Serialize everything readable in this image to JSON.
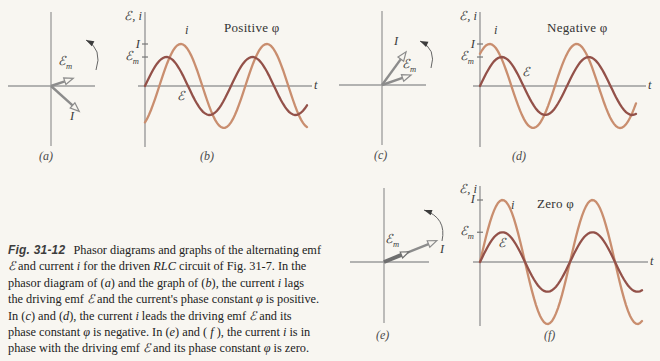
{
  "figure": {
    "symbols": {
      "axis_title": "ℰ, i",
      "emf": "ℰ",
      "m": "m",
      "current_amp": "I",
      "i": "i",
      "t": "t"
    },
    "conditions": {
      "b": "Positive φ",
      "d": "Negative φ",
      "f": "Zero φ"
    },
    "panel_letters": {
      "a": "(a)",
      "b": "(b)",
      "c": "(c)",
      "d": "(d)",
      "e": "(e)",
      "f": "(f)"
    }
  },
  "colors": {
    "current": "#c98e6f",
    "emf": "#935149",
    "axis": "#9b9b9b",
    "phasor_arrow": "#8c8c8c",
    "phasor_arrow_thick": "#6f6f6f",
    "rotation_arrow": "#3c3c3c",
    "background": "#f8f6f1",
    "text": "#3a3a3a"
  },
  "chart_data": [
    {
      "type": "phasor",
      "panel": "a",
      "rotation": "counterclockwise",
      "relationship": "current phasor I below axis: i lags driving emf ℰ, φ positive",
      "arrows": [
        {
          "name": "ℰm",
          "angle_deg": 19,
          "rel_len": 0.62
        },
        {
          "name": "I",
          "angle_deg": -42,
          "rel_len": 1.0
        }
      ]
    },
    {
      "type": "line",
      "panel": "b",
      "title": "Positive φ",
      "ylabel": "ℰ, i",
      "xlabel": "t",
      "yticks": [
        "I",
        "ℰm"
      ],
      "cycles_shown": 1.9,
      "series": [
        {
          "name": "i",
          "amplitude_label": "I",
          "amp_rel": 1.0,
          "phase_deg": -60,
          "color": "current"
        },
        {
          "name": "ℰ",
          "amplitude_label": "ℰm",
          "amp_rel": 0.69,
          "phase_deg": 0,
          "color": "emf"
        }
      ],
      "relationship": "current i lags driving emf ℰ"
    },
    {
      "type": "phasor",
      "panel": "c",
      "rotation": "counterclockwise",
      "relationship": "current phasor I ahead of ℰm: i leads driving emf ℰ, φ negative",
      "arrows": [
        {
          "name": "I",
          "angle_deg": 54,
          "rel_len": 1.0
        },
        {
          "name": "ℰm",
          "angle_deg": 19,
          "rel_len": 0.75
        }
      ]
    },
    {
      "type": "line",
      "panel": "d",
      "title": "Negative φ",
      "ylabel": "ℰ, i",
      "xlabel": "t",
      "yticks": [
        "I",
        "ℰm"
      ],
      "cycles_shown": 1.8,
      "series": [
        {
          "name": "i",
          "amplitude_label": "I",
          "amp_rel": 1.0,
          "phase_deg": 50,
          "color": "current"
        },
        {
          "name": "ℰ",
          "amplitude_label": "ℰm",
          "amp_rel": 0.69,
          "phase_deg": 0,
          "color": "emf"
        }
      ],
      "relationship": "current i leads driving emf ℰ"
    },
    {
      "type": "phasor",
      "panel": "e",
      "rotation": "counterclockwise",
      "relationship": "phasors aligned: i in phase with driving emf ℰ, φ zero",
      "arrows": [
        {
          "name": "I",
          "angle_deg": 22,
          "rel_len": 1.0
        },
        {
          "name": "ℰm",
          "angle_deg": 22,
          "rel_len": 0.47
        }
      ]
    },
    {
      "type": "line",
      "panel": "f",
      "title": "Zero φ",
      "ylabel": "ℰ, i",
      "xlabel": "t",
      "yticks": [
        "I",
        "ℰm"
      ],
      "cycles_shown": 1.8,
      "series": [
        {
          "name": "i",
          "amplitude_label": "I",
          "amp_rel": 1.0,
          "phase_deg": 0,
          "color": "current"
        },
        {
          "name": "ℰ",
          "amplitude_label": "ℰm",
          "amp_rel": 0.48,
          "phase_deg": 0,
          "color": "emf"
        }
      ],
      "relationship": "current i in phase with driving emf ℰ"
    }
  ],
  "caption": {
    "lines": [
      [
        {
          "s": "figlabel",
          "t": "Fig. 31-12"
        },
        {
          "s": "plain",
          "t": " Phasor diagrams and graphs of the alternating emf"
        }
      ],
      [
        {
          "s": "i",
          "t": "ℰ"
        },
        {
          "s": "plain",
          "t": " and current "
        },
        {
          "s": "i",
          "t": "i"
        },
        {
          "s": "plain",
          "t": " for the driven "
        },
        {
          "s": "i",
          "t": "RLC"
        },
        {
          "s": "plain",
          "t": " circuit of Fig. 31-7. In the"
        }
      ],
      [
        {
          "s": "plain",
          "t": "phasor diagram of ("
        },
        {
          "s": "i",
          "t": "a"
        },
        {
          "s": "plain",
          "t": ") and the graph of ("
        },
        {
          "s": "i",
          "t": "b"
        },
        {
          "s": "plain",
          "t": "), the current "
        },
        {
          "s": "i",
          "t": "i"
        },
        {
          "s": "plain",
          "t": " lags"
        }
      ],
      [
        {
          "s": "plain",
          "t": "the driving emf "
        },
        {
          "s": "i",
          "t": "ℰ"
        },
        {
          "s": "plain",
          "t": " and the current's phase constant "
        },
        {
          "s": "i",
          "t": "φ"
        },
        {
          "s": "plain",
          "t": " is positive."
        }
      ],
      [
        {
          "s": "plain",
          "t": "In ("
        },
        {
          "s": "i",
          "t": "c"
        },
        {
          "s": "plain",
          "t": ") and ("
        },
        {
          "s": "i",
          "t": "d"
        },
        {
          "s": "plain",
          "t": "), the current "
        },
        {
          "s": "i",
          "t": "i"
        },
        {
          "s": "plain",
          "t": " leads the driving emf "
        },
        {
          "s": "i",
          "t": "ℰ"
        },
        {
          "s": "plain",
          "t": " and its"
        }
      ],
      [
        {
          "s": "plain",
          "t": "phase constant "
        },
        {
          "s": "i",
          "t": "φ"
        },
        {
          "s": "plain",
          "t": " is negative. In ("
        },
        {
          "s": "i",
          "t": "e"
        },
        {
          "s": "plain",
          "t": ") and ( "
        },
        {
          "s": "i",
          "t": "f"
        },
        {
          "s": "plain",
          "t": " ), the current "
        },
        {
          "s": "i",
          "t": "i"
        },
        {
          "s": "plain",
          "t": " is in"
        }
      ],
      [
        {
          "s": "plain",
          "t": "phase with the driving emf "
        },
        {
          "s": "i",
          "t": "ℰ"
        },
        {
          "s": "plain",
          "t": " and its phase constant "
        },
        {
          "s": "i",
          "t": "φ"
        },
        {
          "s": "plain",
          "t": " is zero."
        }
      ]
    ]
  }
}
